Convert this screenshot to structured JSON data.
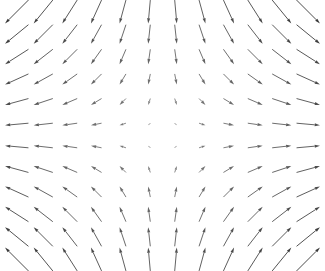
{
  "figure": {
    "name": "quiver-plot",
    "width": 325,
    "height": 271,
    "background_color": "#ffffff",
    "has_axes": false,
    "has_frame": false,
    "has_title": false,
    "has_legend": false,
    "has_tick_labels": false
  },
  "style": {
    "arrow_color": "#4d4d4d",
    "arrow_color_light": "#9a9a9a",
    "shaft_width": 0.9,
    "head_length": 5.2,
    "head_width": 3.0,
    "scale_px_per_unit": 17.0
  },
  "chart_data": {
    "type": "quiver",
    "title": "",
    "xlabel": "",
    "ylabel": "",
    "grid": false,
    "legend": null,
    "field_expression_u": "x",
    "field_expression_v": "-y",
    "nx": 12,
    "ny": 12,
    "x": [
      -1.375,
      -1.125,
      -0.875,
      -0.625,
      -0.375,
      -0.125,
      0.125,
      0.375,
      0.625,
      0.875,
      1.125,
      1.375
    ],
    "y": [
      1.375,
      1.125,
      0.875,
      0.625,
      0.375,
      0.125,
      -0.125,
      -0.375,
      -0.625,
      -0.875,
      -1.125,
      -1.375
    ],
    "xlim": [
      -1.5,
      1.5
    ],
    "ylim": [
      -1.5,
      1.5
    ],
    "origin_px": [
      162.5,
      135.5
    ],
    "spacing_px": [
      26.5,
      22.5
    ],
    "points": [
      {
        "x": -1.375,
        "y": 1.375,
        "u": -1.375,
        "v": -1.375
      },
      {
        "x": -1.125,
        "y": 1.375,
        "u": -1.125,
        "v": -1.375
      },
      {
        "x": -0.875,
        "y": 1.375,
        "u": -0.875,
        "v": -1.375
      },
      {
        "x": -0.625,
        "y": 1.375,
        "u": -0.625,
        "v": -1.375
      },
      {
        "x": -0.375,
        "y": 1.375,
        "u": -0.375,
        "v": -1.375
      },
      {
        "x": -0.125,
        "y": 1.375,
        "u": -0.125,
        "v": -1.375
      },
      {
        "x": 0.125,
        "y": 1.375,
        "u": 0.125,
        "v": -1.375
      },
      {
        "x": 0.375,
        "y": 1.375,
        "u": 0.375,
        "v": -1.375
      },
      {
        "x": 0.625,
        "y": 1.375,
        "u": 0.625,
        "v": -1.375
      },
      {
        "x": 0.875,
        "y": 1.375,
        "u": 0.875,
        "v": -1.375
      },
      {
        "x": 1.125,
        "y": 1.375,
        "u": 1.125,
        "v": -1.375
      },
      {
        "x": 1.375,
        "y": 1.375,
        "u": 1.375,
        "v": -1.375
      },
      {
        "x": -1.375,
        "y": 1.125,
        "u": -1.375,
        "v": -1.125
      },
      {
        "x": -1.125,
        "y": 1.125,
        "u": -1.125,
        "v": -1.125
      },
      {
        "x": -0.875,
        "y": 1.125,
        "u": -0.875,
        "v": -1.125
      },
      {
        "x": -0.625,
        "y": 1.125,
        "u": -0.625,
        "v": -1.125
      },
      {
        "x": -0.375,
        "y": 1.125,
        "u": -0.375,
        "v": -1.125
      },
      {
        "x": -0.125,
        "y": 1.125,
        "u": -0.125,
        "v": -1.125
      },
      {
        "x": 0.125,
        "y": 1.125,
        "u": 0.125,
        "v": -1.125
      },
      {
        "x": 0.375,
        "y": 1.125,
        "u": 0.375,
        "v": -1.125
      },
      {
        "x": 0.625,
        "y": 1.125,
        "u": 0.625,
        "v": -1.125
      },
      {
        "x": 0.875,
        "y": 1.125,
        "u": 0.875,
        "v": -1.125
      },
      {
        "x": 1.125,
        "y": 1.125,
        "u": 1.125,
        "v": -1.125
      },
      {
        "x": 1.375,
        "y": 1.125,
        "u": 1.375,
        "v": -1.125
      },
      {
        "x": -1.375,
        "y": 0.875,
        "u": -1.375,
        "v": -0.875
      },
      {
        "x": -1.125,
        "y": 0.875,
        "u": -1.125,
        "v": -0.875
      },
      {
        "x": -0.875,
        "y": 0.875,
        "u": -0.875,
        "v": -0.875
      },
      {
        "x": -0.625,
        "y": 0.875,
        "u": -0.625,
        "v": -0.875
      },
      {
        "x": -0.375,
        "y": 0.875,
        "u": -0.375,
        "v": -0.875
      },
      {
        "x": -0.125,
        "y": 0.875,
        "u": -0.125,
        "v": -0.875
      },
      {
        "x": 0.125,
        "y": 0.875,
        "u": 0.125,
        "v": -0.875
      },
      {
        "x": 0.375,
        "y": 0.875,
        "u": 0.375,
        "v": -0.875
      },
      {
        "x": 0.625,
        "y": 0.875,
        "u": 0.625,
        "v": -0.875
      },
      {
        "x": 0.875,
        "y": 0.875,
        "u": 0.875,
        "v": -0.875
      },
      {
        "x": 1.125,
        "y": 0.875,
        "u": 1.125,
        "v": -0.875
      },
      {
        "x": 1.375,
        "y": 0.875,
        "u": 1.375,
        "v": -0.875
      },
      {
        "x": -1.375,
        "y": 0.625,
        "u": -1.375,
        "v": -0.625
      },
      {
        "x": -1.125,
        "y": 0.625,
        "u": -1.125,
        "v": -0.625
      },
      {
        "x": -0.875,
        "y": 0.625,
        "u": -0.875,
        "v": -0.625
      },
      {
        "x": -0.625,
        "y": 0.625,
        "u": -0.625,
        "v": -0.625
      },
      {
        "x": -0.375,
        "y": 0.625,
        "u": -0.375,
        "v": -0.625
      },
      {
        "x": -0.125,
        "y": 0.625,
        "u": -0.125,
        "v": -0.625
      },
      {
        "x": 0.125,
        "y": 0.625,
        "u": 0.125,
        "v": -0.625
      },
      {
        "x": 0.375,
        "y": 0.625,
        "u": 0.375,
        "v": -0.625
      },
      {
        "x": 0.625,
        "y": 0.625,
        "u": 0.625,
        "v": -0.625
      },
      {
        "x": 0.875,
        "y": 0.625,
        "u": 0.875,
        "v": -0.625
      },
      {
        "x": 1.125,
        "y": 0.625,
        "u": 1.125,
        "v": -0.625
      },
      {
        "x": 1.375,
        "y": 0.625,
        "u": 1.375,
        "v": -0.625
      },
      {
        "x": -1.375,
        "y": 0.375,
        "u": -1.375,
        "v": -0.375
      },
      {
        "x": -1.125,
        "y": 0.375,
        "u": -1.125,
        "v": -0.375
      },
      {
        "x": -0.875,
        "y": 0.375,
        "u": -0.875,
        "v": -0.375
      },
      {
        "x": -0.625,
        "y": 0.375,
        "u": -0.625,
        "v": -0.375
      },
      {
        "x": -0.375,
        "y": 0.375,
        "u": -0.375,
        "v": -0.375
      },
      {
        "x": -0.125,
        "y": 0.375,
        "u": -0.125,
        "v": -0.375
      },
      {
        "x": 0.125,
        "y": 0.375,
        "u": 0.125,
        "v": -0.375
      },
      {
        "x": 0.375,
        "y": 0.375,
        "u": 0.375,
        "v": -0.375
      },
      {
        "x": 0.625,
        "y": 0.375,
        "u": 0.625,
        "v": -0.375
      },
      {
        "x": 0.875,
        "y": 0.375,
        "u": 0.875,
        "v": -0.375
      },
      {
        "x": 1.125,
        "y": 0.375,
        "u": 1.125,
        "v": -0.375
      },
      {
        "x": 1.375,
        "y": 0.375,
        "u": 1.375,
        "v": -0.375
      },
      {
        "x": -1.375,
        "y": 0.125,
        "u": -1.375,
        "v": -0.125
      },
      {
        "x": -1.125,
        "y": 0.125,
        "u": -1.125,
        "v": -0.125
      },
      {
        "x": -0.875,
        "y": 0.125,
        "u": -0.875,
        "v": -0.125
      },
      {
        "x": -0.625,
        "y": 0.125,
        "u": -0.625,
        "v": -0.125
      },
      {
        "x": -0.375,
        "y": 0.125,
        "u": -0.375,
        "v": -0.125
      },
      {
        "x": -0.125,
        "y": 0.125,
        "u": -0.125,
        "v": -0.125
      },
      {
        "x": 0.125,
        "y": 0.125,
        "u": 0.125,
        "v": -0.125
      },
      {
        "x": 0.375,
        "y": 0.125,
        "u": 0.375,
        "v": -0.125
      },
      {
        "x": 0.625,
        "y": 0.125,
        "u": 0.625,
        "v": -0.125
      },
      {
        "x": 0.875,
        "y": 0.125,
        "u": 0.875,
        "v": -0.125
      },
      {
        "x": 1.125,
        "y": 0.125,
        "u": 1.125,
        "v": -0.125
      },
      {
        "x": 1.375,
        "y": 0.125,
        "u": 1.375,
        "v": -0.125
      },
      {
        "x": -1.375,
        "y": -0.125,
        "u": -1.375,
        "v": 0.125
      },
      {
        "x": -1.125,
        "y": -0.125,
        "u": -1.125,
        "v": 0.125
      },
      {
        "x": -0.875,
        "y": -0.125,
        "u": -0.875,
        "v": 0.125
      },
      {
        "x": -0.625,
        "y": -0.125,
        "u": -0.625,
        "v": 0.125
      },
      {
        "x": -0.375,
        "y": -0.125,
        "u": -0.375,
        "v": 0.125
      },
      {
        "x": -0.125,
        "y": -0.125,
        "u": -0.125,
        "v": 0.125
      },
      {
        "x": 0.125,
        "y": -0.125,
        "u": 0.125,
        "v": 0.125
      },
      {
        "x": 0.375,
        "y": -0.125,
        "u": 0.375,
        "v": 0.125
      },
      {
        "x": 0.625,
        "y": -0.125,
        "u": 0.625,
        "v": 0.125
      },
      {
        "x": 0.875,
        "y": -0.125,
        "u": 0.875,
        "v": 0.125
      },
      {
        "x": 1.125,
        "y": -0.125,
        "u": 1.125,
        "v": 0.125
      },
      {
        "x": 1.375,
        "y": -0.125,
        "u": 1.375,
        "v": 0.125
      },
      {
        "x": -1.375,
        "y": -0.375,
        "u": -1.375,
        "v": 0.375
      },
      {
        "x": -1.125,
        "y": -0.375,
        "u": -1.125,
        "v": 0.375
      },
      {
        "x": -0.875,
        "y": -0.375,
        "u": -0.875,
        "v": 0.375
      },
      {
        "x": -0.625,
        "y": -0.375,
        "u": -0.625,
        "v": 0.375
      },
      {
        "x": -0.375,
        "y": -0.375,
        "u": -0.375,
        "v": 0.375
      },
      {
        "x": -0.125,
        "y": -0.375,
        "u": -0.125,
        "v": 0.375
      },
      {
        "x": 0.125,
        "y": -0.375,
        "u": 0.125,
        "v": 0.375
      },
      {
        "x": 0.375,
        "y": -0.375,
        "u": 0.375,
        "v": 0.375
      },
      {
        "x": 0.625,
        "y": -0.375,
        "u": 0.625,
        "v": 0.375
      },
      {
        "x": 0.875,
        "y": -0.375,
        "u": 0.875,
        "v": 0.375
      },
      {
        "x": 1.125,
        "y": -0.375,
        "u": 1.125,
        "v": 0.375
      },
      {
        "x": 1.375,
        "y": -0.375,
        "u": 1.375,
        "v": 0.375
      },
      {
        "x": -1.375,
        "y": -0.625,
        "u": -1.375,
        "v": 0.625
      },
      {
        "x": -1.125,
        "y": -0.625,
        "u": -1.125,
        "v": 0.625
      },
      {
        "x": -0.875,
        "y": -0.625,
        "u": -0.875,
        "v": 0.625
      },
      {
        "x": -0.625,
        "y": -0.625,
        "u": -0.625,
        "v": 0.625
      },
      {
        "x": -0.375,
        "y": -0.625,
        "u": -0.375,
        "v": 0.625
      },
      {
        "x": -0.125,
        "y": -0.625,
        "u": -0.125,
        "v": 0.625
      },
      {
        "x": 0.125,
        "y": -0.625,
        "u": 0.125,
        "v": 0.625
      },
      {
        "x": 0.375,
        "y": -0.625,
        "u": 0.375,
        "v": 0.625
      },
      {
        "x": 0.625,
        "y": -0.625,
        "u": 0.625,
        "v": 0.625
      },
      {
        "x": 0.875,
        "y": -0.625,
        "u": 0.875,
        "v": 0.625
      },
      {
        "x": 1.125,
        "y": -0.625,
        "u": 1.125,
        "v": 0.625
      },
      {
        "x": 1.375,
        "y": -0.625,
        "u": 1.375,
        "v": 0.625
      },
      {
        "x": -1.375,
        "y": -0.875,
        "u": -1.375,
        "v": 0.875
      },
      {
        "x": -1.125,
        "y": -0.875,
        "u": -1.125,
        "v": 0.875
      },
      {
        "x": -0.875,
        "y": -0.875,
        "u": -0.875,
        "v": 0.875
      },
      {
        "x": -0.625,
        "y": -0.875,
        "u": -0.625,
        "v": 0.875
      },
      {
        "x": -0.375,
        "y": -0.875,
        "u": -0.375,
        "v": 0.875
      },
      {
        "x": -0.125,
        "y": -0.875,
        "u": -0.125,
        "v": 0.875
      },
      {
        "x": 0.125,
        "y": -0.875,
        "u": 0.125,
        "v": 0.875
      },
      {
        "x": 0.375,
        "y": -0.875,
        "u": 0.375,
        "v": 0.875
      },
      {
        "x": 0.625,
        "y": -0.875,
        "u": 0.625,
        "v": 0.875
      },
      {
        "x": 0.875,
        "y": -0.875,
        "u": 0.875,
        "v": 0.875
      },
      {
        "x": 1.125,
        "y": -0.875,
        "u": 1.125,
        "v": 0.875
      },
      {
        "x": 1.375,
        "y": -0.875,
        "u": 1.375,
        "v": 0.875
      },
      {
        "x": -1.375,
        "y": -1.125,
        "u": -1.375,
        "v": 1.125
      },
      {
        "x": -1.125,
        "y": -1.125,
        "u": -1.125,
        "v": 1.125
      },
      {
        "x": -0.875,
        "y": -1.125,
        "u": -0.875,
        "v": 1.125
      },
      {
        "x": -0.625,
        "y": -1.125,
        "u": -0.625,
        "v": 1.125
      },
      {
        "x": -0.375,
        "y": -1.125,
        "u": -0.375,
        "v": 1.125
      },
      {
        "x": -0.125,
        "y": -1.125,
        "u": -0.125,
        "v": 1.125
      },
      {
        "x": 0.125,
        "y": -1.125,
        "u": 0.125,
        "v": 1.125
      },
      {
        "x": 0.375,
        "y": -1.125,
        "u": 0.375,
        "v": 1.125
      },
      {
        "x": 0.625,
        "y": -1.125,
        "u": 0.625,
        "v": 1.125
      },
      {
        "x": 0.875,
        "y": -1.125,
        "u": 0.875,
        "v": 1.125
      },
      {
        "x": 1.125,
        "y": -1.125,
        "u": 1.125,
        "v": 1.125
      },
      {
        "x": 1.375,
        "y": -1.125,
        "u": 1.375,
        "v": 1.125
      },
      {
        "x": -1.375,
        "y": -1.375,
        "u": -1.375,
        "v": 1.375
      },
      {
        "x": -1.125,
        "y": -1.375,
        "u": -1.125,
        "v": 1.375
      },
      {
        "x": -0.875,
        "y": -1.375,
        "u": -0.875,
        "v": 1.375
      },
      {
        "x": -0.625,
        "y": -1.375,
        "u": -0.625,
        "v": 1.375
      },
      {
        "x": -0.375,
        "y": -1.375,
        "u": -0.375,
        "v": 1.375
      },
      {
        "x": -0.125,
        "y": -1.375,
        "u": -0.125,
        "v": 1.375
      },
      {
        "x": 0.125,
        "y": -1.375,
        "u": 0.125,
        "v": 1.375
      },
      {
        "x": 0.375,
        "y": -1.375,
        "u": 0.375,
        "v": 1.375
      },
      {
        "x": 0.625,
        "y": -1.375,
        "u": 0.625,
        "v": 1.375
      },
      {
        "x": 0.875,
        "y": -1.375,
        "u": 0.875,
        "v": 1.375
      },
      {
        "x": 1.125,
        "y": -1.375,
        "u": 1.125,
        "v": 1.375
      },
      {
        "x": 1.375,
        "y": -1.375,
        "u": 1.375,
        "v": 1.375
      }
    ]
  }
}
